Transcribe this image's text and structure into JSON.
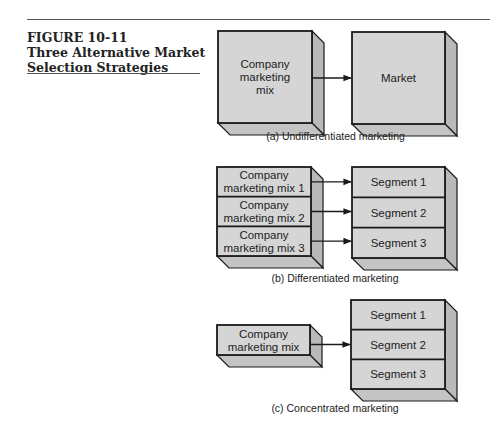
{
  "figure": {
    "number": "FIGURE 10-11",
    "title_line1": "Three Alternative Market",
    "title_line2": "Selection Strategies"
  },
  "panels": [
    {
      "id": "a",
      "caption": "(a)  Undifferentiated marketing",
      "left_box": {
        "rows": [
          [
            "Company",
            "marketing",
            "mix"
          ]
        ]
      },
      "right_box": {
        "rows": [
          [
            "Market"
          ]
        ]
      },
      "arrows_to": [
        0
      ]
    },
    {
      "id": "b",
      "caption": "(b)  Differentiated marketing",
      "left_box": {
        "rows": [
          [
            "Company",
            "marketing mix 1"
          ],
          [
            "Company",
            "marketing mix 2"
          ],
          [
            "Company",
            "marketing mix 3"
          ]
        ]
      },
      "right_box": {
        "rows": [
          [
            "Segment 1"
          ],
          [
            "Segment 2"
          ],
          [
            "Segment 3"
          ]
        ]
      },
      "arrows_to": [
        0,
        1,
        2
      ]
    },
    {
      "id": "c",
      "caption": "(c)  Concentrated marketing",
      "left_box": {
        "rows": [
          [
            "Company",
            "marketing mix"
          ]
        ]
      },
      "right_box": {
        "rows": [
          [
            "Segment 1"
          ],
          [
            "Segment 2"
          ],
          [
            "Segment 3"
          ]
        ]
      },
      "arrows_to": [
        1
      ]
    }
  ],
  "colors": {
    "face": "#d5d5d5",
    "side": "#b9b9b9",
    "bottom": "#c4c4c4",
    "stroke": "#1a1a1a"
  }
}
